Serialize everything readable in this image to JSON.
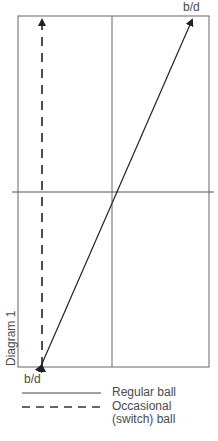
{
  "diagram": {
    "title": "Diagram 1",
    "top_label": "b/d",
    "bottom_label": "b/d",
    "lines": [
      {
        "style": "solid",
        "from": "bottom-left",
        "to": "top-right",
        "arrowheads": "both"
      },
      {
        "style": "dashed",
        "from": "bottom-left",
        "to": "top-left",
        "arrowheads": "both"
      }
    ],
    "legend": [
      {
        "style": "solid",
        "label": "Regular ball"
      },
      {
        "style": "dashed",
        "label": "Occasional\n(switch) ball",
        "label_line1": "Occasional",
        "label_line2": "(switch) ball"
      }
    ],
    "colors": {
      "line": "#2a2a2a",
      "frame": "#555555",
      "text": "#4a4a4a"
    }
  }
}
